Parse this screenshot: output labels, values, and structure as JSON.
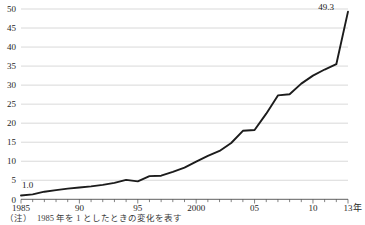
{
  "chart_data": {
    "type": "line",
    "title": "",
    "xlabel": "年",
    "ylabel": "",
    "xlim": [
      1985,
      2013
    ],
    "ylim": [
      0,
      50
    ],
    "grid": true,
    "legend": "none",
    "x": [
      1985,
      1986,
      1987,
      1988,
      1989,
      1990,
      1991,
      1992,
      1993,
      1994,
      1995,
      1996,
      1997,
      1998,
      1999,
      2000,
      2001,
      2002,
      2003,
      2004,
      2005,
      2006,
      2007,
      2008,
      2009,
      2010,
      2011,
      2012,
      2013
    ],
    "values": [
      1.0,
      1.3,
      2.0,
      2.4,
      2.8,
      3.1,
      3.4,
      3.8,
      4.3,
      5.1,
      4.7,
      6.1,
      6.2,
      7.2,
      8.3,
      9.9,
      11.4,
      12.7,
      14.8,
      18.0,
      18.2,
      22.5,
      27.3,
      27.6,
      30.4,
      32.5,
      34.1,
      35.5,
      49.3
    ],
    "series": [
      {
        "name": "index",
        "values": [
          1.0,
          1.3,
          2.0,
          2.4,
          2.8,
          3.1,
          3.4,
          3.8,
          4.3,
          5.1,
          4.7,
          6.1,
          6.2,
          7.2,
          8.3,
          9.9,
          11.4,
          12.7,
          14.8,
          18.0,
          18.2,
          22.5,
          27.3,
          27.6,
          30.4,
          32.5,
          34.1,
          35.5,
          49.3
        ],
        "color": "#1c1c1c"
      }
    ],
    "y_ticks": [
      0,
      5,
      10,
      15,
      20,
      25,
      30,
      35,
      40,
      45,
      50
    ],
    "y_tick_labels": [
      "0",
      "5",
      "10",
      "15",
      "20",
      "25",
      "30",
      "35",
      "40",
      "45",
      "50"
    ],
    "x_ticks": [
      1985,
      1990,
      1995,
      2000,
      2005,
      2010,
      2013
    ],
    "x_tick_labels": [
      "1985",
      "90",
      "95",
      "2000",
      "05",
      "10",
      "13"
    ],
    "x_axis_unit_label": "年",
    "annotations": [
      {
        "name": "first-point-label",
        "text": "1.0",
        "x": 1985,
        "y": 1.0
      },
      {
        "name": "last-point-label",
        "text": "49.3",
        "x": 2013,
        "y": 49.3
      }
    ]
  },
  "footnote": {
    "text": "（注）　1985 年を 1 としたときの変化を表す"
  }
}
